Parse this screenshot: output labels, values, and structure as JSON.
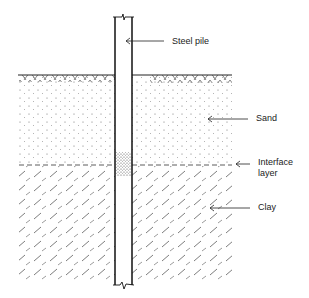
{
  "diagram": {
    "type": "geotechnical-cross-section",
    "labels": {
      "steel_pile": "Steel pile",
      "sand": "Sand",
      "interface_line1": "Interface",
      "interface_line2": "layer",
      "clay": "Clay"
    },
    "layers": [
      {
        "name": "Sand",
        "pattern": "stipple"
      },
      {
        "name": "Interface layer",
        "pattern": "dense-stipple-dashed-boundary"
      },
      {
        "name": "Clay",
        "pattern": "diagonal-dashes"
      }
    ],
    "elements": [
      "ground surface hatching",
      "steel pile with break symbols top and bottom"
    ],
    "colors": {
      "ink": "#222222",
      "background": "#ffffff"
    }
  }
}
